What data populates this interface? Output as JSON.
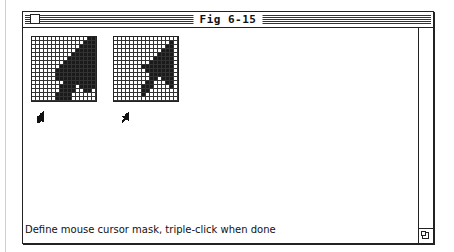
{
  "window": {
    "title": "Fig 6-15",
    "close_box_icon": "close-box-icon",
    "grow_box_icon": "grow-box-icon"
  },
  "editor": {
    "mask_grid": {
      "label": "mask",
      "size": 16,
      "rows": [
        "0000000000000011",
        "0000000000000111",
        "0000000000001111",
        "0000000000011111",
        "0000000000111111",
        "0000000001111111",
        "0000000011111111",
        "0000000111111111",
        "0000001111111111",
        "0000001111111111",
        "0000001111111111",
        "0000000011111111",
        "0000000111101111",
        "0000000111100110",
        "0000001111000000",
        "0000001111000000"
      ]
    },
    "cursor_grid": {
      "label": "cursor",
      "size": 16,
      "rows": [
        "0000000000000000",
        "0000000000000010",
        "0000000000000110",
        "0000000000001110",
        "0000000000011110",
        "0000000000111110",
        "0000000001111110",
        "0000000111111110",
        "0000000011111110",
        "0000000001111110",
        "0000000001101110",
        "0000000011000110",
        "0000000111000010",
        "0000000110000000",
        "0000000100000000",
        "0000000000000000"
      ]
    }
  },
  "status": {
    "prompt": "Define mouse cursor mask, triple-click when done"
  },
  "colors": {
    "ink": "#1a1a1a",
    "paper": "#ffffff"
  }
}
